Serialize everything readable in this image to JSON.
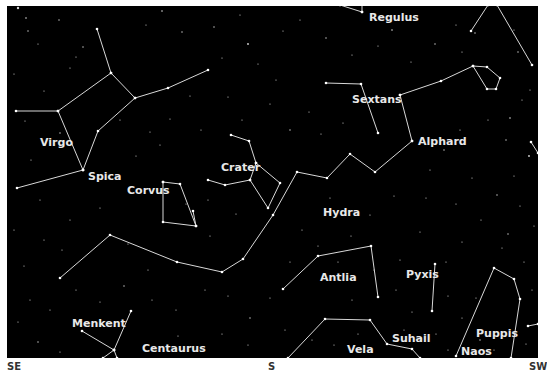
{
  "colors": {
    "sky": "#000000",
    "line": "#d8d8d8",
    "label": "#e8e8e8",
    "star": "#ffffff",
    "direction": "#333333"
  },
  "directions": [
    {
      "label": "SE",
      "x": 7
    },
    {
      "label": "S",
      "x": 268
    },
    {
      "label": "SW",
      "x": 529
    }
  ],
  "labels": [
    {
      "text": "Regulus",
      "x": 369,
      "y": 21,
      "kind": "star"
    },
    {
      "text": "Sextans",
      "x": 352,
      "y": 103,
      "kind": "constellation"
    },
    {
      "text": "Alphard",
      "x": 418,
      "y": 145,
      "kind": "star"
    },
    {
      "text": "Virgo",
      "x": 40,
      "y": 146,
      "kind": "constellation"
    },
    {
      "text": "Spica",
      "x": 88,
      "y": 180,
      "kind": "star"
    },
    {
      "text": "Crater",
      "x": 221,
      "y": 171,
      "kind": "constellation"
    },
    {
      "text": "Corvus",
      "x": 127,
      "y": 194,
      "kind": "constellation"
    },
    {
      "text": "Hydra",
      "x": 323,
      "y": 216,
      "kind": "constellation"
    },
    {
      "text": "Antlia",
      "x": 320,
      "y": 281,
      "kind": "constellation"
    },
    {
      "text": "Pyxis",
      "x": 406,
      "y": 278,
      "kind": "constellation"
    },
    {
      "text": "Menkent",
      "x": 72,
      "y": 327,
      "kind": "star"
    },
    {
      "text": "Centaurus",
      "x": 142,
      "y": 352,
      "kind": "constellation"
    },
    {
      "text": "Suhail",
      "x": 392,
      "y": 342,
      "kind": "star"
    },
    {
      "text": "Vela",
      "x": 347,
      "y": 353,
      "kind": "constellation"
    },
    {
      "text": "Puppis",
      "x": 476,
      "y": 337,
      "kind": "constellation"
    },
    {
      "text": "Naos",
      "x": 461,
      "y": 355,
      "kind": "star"
    }
  ],
  "constellations": [
    {
      "name": "Virgo",
      "lines": [
        [
          [
            97,
            29
          ],
          [
            111,
            73
          ],
          [
            135,
            98
          ],
          [
            168,
            88
          ],
          [
            208,
            70
          ]
        ],
        [
          [
            111,
            73
          ],
          [
            58,
            111
          ],
          [
            16,
            111
          ]
        ],
        [
          [
            58,
            111
          ],
          [
            83,
            170
          ]
        ],
        [
          [
            135,
            98
          ],
          [
            98,
            131
          ],
          [
            83,
            170
          ]
        ],
        [
          [
            83,
            170
          ],
          [
            17,
            188
          ]
        ]
      ]
    },
    {
      "name": "Leo-Regulus",
      "lines": [
        [
          [
            340,
            5
          ],
          [
            362,
            12
          ]
        ],
        [
          [
            362,
            12
          ],
          [
            362,
            4
          ]
        ]
      ]
    },
    {
      "name": "Leo-right",
      "lines": [
        [
          [
            471,
            31
          ],
          [
            488,
            5
          ]
        ],
        [
          [
            497,
            5
          ],
          [
            532,
            65
          ]
        ]
      ]
    },
    {
      "name": "Sextans",
      "lines": [
        [
          [
            326,
            83
          ],
          [
            361,
            84
          ],
          [
            378,
            133
          ]
        ]
      ]
    },
    {
      "name": "Hydra",
      "lines": [
        [
          [
            400,
            95
          ],
          [
            441,
            81
          ],
          [
            473,
            66
          ],
          [
            487,
            67
          ],
          [
            500,
            78
          ],
          [
            496,
            89
          ],
          [
            487,
            89
          ],
          [
            473,
            66
          ]
        ],
        [
          [
            400,
            95
          ],
          [
            412,
            141
          ]
        ],
        [
          [
            412,
            141
          ],
          [
            375,
            172
          ],
          [
            350,
            154
          ],
          [
            327,
            178
          ],
          [
            297,
            172
          ],
          [
            273,
            215
          ],
          [
            243,
            259
          ],
          [
            222,
            272
          ],
          [
            177,
            262
          ],
          [
            110,
            235
          ],
          [
            60,
            278
          ]
        ]
      ]
    },
    {
      "name": "Crater",
      "lines": [
        [
          [
            231,
            135
          ],
          [
            249,
            141
          ],
          [
            256,
            163
          ],
          [
            280,
            183
          ],
          [
            268,
            208
          ],
          [
            250,
            180
          ],
          [
            256,
            163
          ]
        ],
        [
          [
            250,
            180
          ],
          [
            225,
            185
          ],
          [
            208,
            180
          ]
        ]
      ]
    },
    {
      "name": "Corvus",
      "lines": [
        [
          [
            163,
            182
          ],
          [
            180,
            184
          ],
          [
            196,
            226
          ],
          [
            163,
            222
          ],
          [
            163,
            182
          ]
        ],
        [
          [
            193,
            211
          ],
          [
            196,
            226
          ]
        ]
      ]
    },
    {
      "name": "Antlia",
      "lines": [
        [
          [
            283,
            289
          ],
          [
            318,
            256
          ],
          [
            371,
            246
          ],
          [
            378,
            297
          ]
        ]
      ]
    },
    {
      "name": "Pyxis",
      "lines": [
        [
          [
            435,
            264
          ],
          [
            432,
            311
          ]
        ]
      ]
    },
    {
      "name": "Vela",
      "lines": [
        [
          [
            288,
            358
          ],
          [
            325,
            319
          ],
          [
            370,
            320
          ],
          [
            387,
            344
          ],
          [
            412,
            349
          ],
          [
            420,
            358
          ]
        ]
      ]
    },
    {
      "name": "Puppis",
      "lines": [
        [
          [
            456,
            356
          ],
          [
            494,
            268
          ],
          [
            514,
            279
          ],
          [
            520,
            299
          ],
          [
            511,
            358
          ]
        ],
        [
          [
            528,
            326
          ],
          [
            538,
            324
          ]
        ]
      ]
    },
    {
      "name": "Centaurus",
      "lines": [
        [
          [
            82,
            331
          ],
          [
            114,
            350
          ],
          [
            131,
            311
          ]
        ],
        [
          [
            114,
            350
          ],
          [
            103,
            358
          ]
        ],
        [
          [
            114,
            350
          ],
          [
            117,
            358
          ]
        ]
      ]
    },
    {
      "name": "edge-right",
      "lines": [
        [
          [
            531,
            142
          ],
          [
            538,
            153
          ]
        ]
      ]
    }
  ],
  "stars": [
    [
      18,
      8,
      1.2
    ],
    [
      26,
      18,
      0.8
    ],
    [
      28,
      31,
      0.7
    ],
    [
      59,
      20,
      0.7
    ],
    [
      38,
      44,
      0.6
    ],
    [
      76,
      57,
      0.6
    ],
    [
      14,
      74,
      0.6
    ],
    [
      83,
      47,
      0.7
    ],
    [
      70,
      68,
      0.6
    ],
    [
      44,
      91,
      0.6
    ],
    [
      25,
      121,
      0.6
    ],
    [
      60,
      133,
      0.7
    ],
    [
      31,
      160,
      0.6
    ],
    [
      146,
      25,
      0.6
    ],
    [
      162,
      11,
      0.8
    ],
    [
      182,
      32,
      0.7
    ],
    [
      214,
      27,
      0.7
    ],
    [
      240,
      15,
      0.6
    ],
    [
      248,
      44,
      0.9
    ],
    [
      222,
      58,
      0.6
    ],
    [
      190,
      96,
      0.6
    ],
    [
      170,
      119,
      0.6
    ],
    [
      160,
      145,
      0.6
    ],
    [
      201,
      130,
      0.6
    ],
    [
      228,
      97,
      0.6
    ],
    [
      258,
      64,
      0.6
    ],
    [
      283,
      31,
      0.6
    ],
    [
      300,
      20,
      0.6
    ],
    [
      326,
      38,
      0.7
    ],
    [
      352,
      55,
      0.6
    ],
    [
      378,
      46,
      0.6
    ],
    [
      392,
      30,
      0.8
    ],
    [
      411,
      62,
      0.6
    ],
    [
      435,
      44,
      0.7
    ],
    [
      456,
      25,
      0.6
    ],
    [
      462,
      52,
      0.6
    ],
    [
      475,
      33,
      0.7
    ],
    [
      514,
      30,
      0.6
    ],
    [
      518,
      52,
      0.7
    ],
    [
      530,
      90,
      0.6
    ],
    [
      510,
      118,
      0.8
    ],
    [
      522,
      100,
      0.6
    ],
    [
      506,
      140,
      0.7
    ],
    [
      529,
      156,
      0.9
    ],
    [
      514,
      176,
      0.6
    ],
    [
      488,
      120,
      0.6
    ],
    [
      460,
      130,
      0.6
    ],
    [
      444,
      150,
      0.7
    ],
    [
      430,
      170,
      0.6
    ],
    [
      472,
      178,
      0.6
    ],
    [
      497,
      195,
      0.7
    ],
    [
      520,
      206,
      0.6
    ],
    [
      534,
      226,
      0.6
    ],
    [
      508,
      234,
      0.7
    ],
    [
      481,
      220,
      0.6
    ],
    [
      456,
      204,
      0.6
    ],
    [
      426,
      198,
      0.6
    ],
    [
      394,
      196,
      0.6
    ],
    [
      370,
      215,
      0.6
    ],
    [
      351,
      236,
      0.6
    ],
    [
      309,
      112,
      0.6
    ],
    [
      290,
      130,
      0.7
    ],
    [
      321,
      134,
      0.6
    ],
    [
      343,
      123,
      0.6
    ],
    [
      330,
      198,
      0.6
    ],
    [
      302,
      230,
      0.6
    ],
    [
      318,
      246,
      0.6
    ],
    [
      290,
      262,
      0.6
    ],
    [
      270,
      298,
      0.6
    ],
    [
      250,
      318,
      0.7
    ],
    [
      228,
      296,
      0.6
    ],
    [
      205,
      290,
      0.6
    ],
    [
      176,
      310,
      0.6
    ],
    [
      152,
      300,
      0.6
    ],
    [
      124,
      286,
      0.7
    ],
    [
      100,
      302,
      0.6
    ],
    [
      76,
      290,
      0.6
    ],
    [
      50,
      310,
      0.6
    ],
    [
      30,
      300,
      0.6
    ],
    [
      18,
      322,
      0.6
    ],
    [
      38,
      342,
      0.7
    ],
    [
      60,
      352,
      0.6
    ],
    [
      24,
      266,
      0.6
    ],
    [
      44,
      240,
      0.6
    ],
    [
      70,
      220,
      0.6
    ],
    [
      100,
      208,
      0.6
    ],
    [
      128,
      244,
      0.6
    ],
    [
      148,
      270,
      0.6
    ],
    [
      210,
      236,
      0.6
    ],
    [
      236,
      214,
      0.6
    ],
    [
      338,
      262,
      0.6
    ],
    [
      352,
      300,
      0.6
    ],
    [
      396,
      290,
      0.6
    ],
    [
      412,
      312,
      0.6
    ],
    [
      448,
      296,
      0.6
    ],
    [
      462,
      318,
      0.6
    ],
    [
      476,
      298,
      0.6
    ],
    [
      436,
      334,
      0.6
    ],
    [
      404,
      330,
      0.6
    ],
    [
      358,
      334,
      0.6
    ],
    [
      334,
      345,
      0.6
    ],
    [
      312,
      340,
      0.6
    ],
    [
      285,
      330,
      0.6
    ],
    [
      248,
      345,
      0.6
    ],
    [
      222,
      334,
      0.6
    ],
    [
      200,
      350,
      0.6
    ],
    [
      178,
      336,
      0.6
    ],
    [
      524,
      262,
      0.6
    ],
    [
      532,
      290,
      0.6
    ],
    [
      502,
      248,
      0.6
    ],
    [
      462,
      242,
      0.6
    ],
    [
      446,
      262,
      0.6
    ],
    [
      420,
      232,
      0.6
    ],
    [
      400,
      260,
      0.6
    ],
    [
      374,
      270,
      0.6
    ],
    [
      526,
      344,
      0.6
    ],
    [
      494,
      350,
      0.6
    ],
    [
      480,
      340,
      0.7
    ],
    [
      448,
      350,
      0.6
    ],
    [
      242,
      120,
      0.6
    ],
    [
      136,
      156,
      0.6
    ],
    [
      150,
      132,
      0.6
    ],
    [
      120,
      120,
      0.6
    ],
    [
      186,
      204,
      0.6
    ],
    [
      208,
      200,
      0.6
    ],
    [
      40,
      200,
      0.6
    ],
    [
      62,
      250,
      0.6
    ],
    [
      14,
      230,
      0.6
    ],
    [
      270,
      104,
      0.6
    ],
    [
      276,
      80,
      0.6
    ]
  ]
}
